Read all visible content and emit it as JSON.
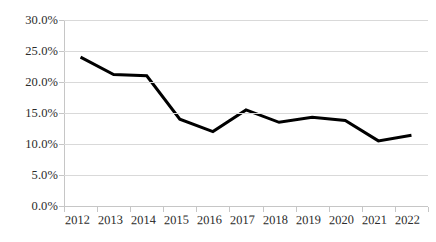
{
  "chart_data": {
    "type": "line",
    "title": "",
    "subtitle": "",
    "xlabel": "",
    "ylabel": "",
    "categories": [
      "2012",
      "2013",
      "2014",
      "2015",
      "2016",
      "2017",
      "2018",
      "2019",
      "2020",
      "2021",
      "2022"
    ],
    "values": [
      24.0,
      21.2,
      21.0,
      14.0,
      12.0,
      15.5,
      13.5,
      14.3,
      13.8,
      10.5,
      11.4
    ],
    "value_format": "percent",
    "series": [
      {
        "name": "",
        "values": [
          24.0,
          21.2,
          21.0,
          14.0,
          12.0,
          15.5,
          13.5,
          14.3,
          13.8,
          10.5,
          11.4
        ],
        "color": "#000000",
        "line_width": 3
      }
    ],
    "ylim": [
      0.0,
      30.0
    ],
    "ytick_step": 5.0,
    "ytick_labels": [
      "0.0%",
      "5.0%",
      "10.0%",
      "15.0%",
      "20.0%",
      "25.0%",
      "30.0%"
    ],
    "ytick_values": [
      0.0,
      5.0,
      10.0,
      15.0,
      20.0,
      25.0,
      30.0
    ],
    "grid": true,
    "grid_axis": "y",
    "grid_color": "#d9d9d9",
    "axis_color": "#c6c6c6",
    "legend": false,
    "legend_position": "none",
    "markers": false,
    "background": "#ffffff",
    "text_color": "#2b2b2b"
  }
}
